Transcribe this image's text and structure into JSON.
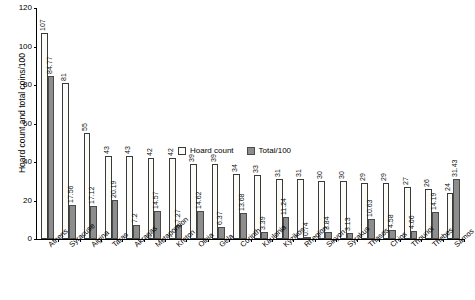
{
  "chart_data": {
    "type": "bar",
    "title": "",
    "subtitle": "",
    "xlabel": "",
    "ylabel": "Hoard count and total coins/100",
    "ylim": [
      0,
      120
    ],
    "ytick_values": [
      0,
      20,
      40,
      60,
      80,
      100,
      120
    ],
    "ytick_labels": [
      "0",
      "20",
      "40",
      "60",
      "80",
      "100",
      "120"
    ],
    "grid": false,
    "legend_position": "inside-upper-center",
    "categories": [
      "Athens",
      "Syracuse",
      "Aigina",
      "Taras",
      "Akragas",
      "Metapontion",
      "Kroton",
      "Olbia",
      "Gela",
      "Corinth",
      "Kaulonia",
      "Kyzikos",
      "Rhegion",
      "Sikyon",
      "Syrakus",
      "Thasos",
      "Chios",
      "Thourioi",
      "Thebes",
      "Samos"
    ],
    "series": [
      {
        "name": "Hoard count",
        "color": "#fbfbf8",
        "values": [
          107,
          81,
          55,
          43,
          43,
          42,
          42,
          39,
          39,
          34,
          33,
          31,
          31,
          30,
          30,
          29,
          29,
          27,
          26,
          24
        ],
        "labels": [
          "107",
          "81",
          "55",
          "43",
          "43",
          "42",
          "42",
          "39",
          "39",
          "34",
          "33",
          "31",
          "31",
          "30",
          "30",
          "29",
          "29",
          "27",
          "26",
          "24"
        ]
      },
      {
        "name": "Total/100",
        "color": "#8d8d8d",
        "values": [
          84.77,
          17.56,
          17.12,
          20.19,
          7.2,
          14.57,
          7.27,
          14.62,
          6.37,
          13.68,
          3.39,
          11.24,
          0.74,
          3.84,
          3.13,
          10.63,
          4.58,
          4.06,
          14.19,
          31.43
        ],
        "labels": [
          "84.77",
          "17.56",
          "17.12",
          "20.19",
          "7.2",
          "14.57",
          "7.27",
          "14.62",
          "6.37",
          "13.68",
          "3.39",
          "11.24",
          "0.74",
          "3.84",
          "3.13",
          "10.63",
          "4.58",
          "4.06",
          "14.19",
          "31.43"
        ]
      }
    ]
  },
  "legend": {
    "items": [
      {
        "label": "Hoard count"
      },
      {
        "label": "Total/100"
      }
    ]
  },
  "axis": {
    "y_title": "Hoard count and total coins/100"
  }
}
